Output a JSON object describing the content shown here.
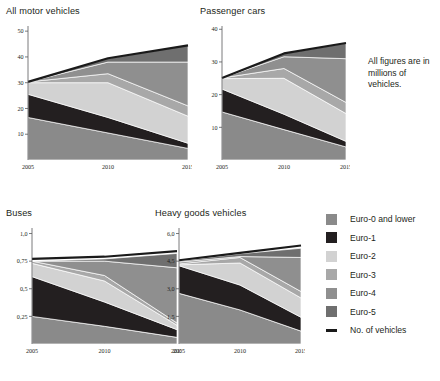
{
  "note": {
    "text": "All figures are in millions of vehicles."
  },
  "legend": {
    "items": [
      {
        "label": "Euro-0 and lower",
        "color": "#8a8a8a",
        "kind": "swatch"
      },
      {
        "label": "Euro-1",
        "color": "#231f20",
        "kind": "swatch"
      },
      {
        "label": "Euro-2",
        "color": "#d2d2d2",
        "kind": "swatch"
      },
      {
        "label": "Euro-3",
        "color": "#a8a8a8",
        "kind": "swatch"
      },
      {
        "label": "Euro-4",
        "color": "#8f8f8f",
        "kind": "swatch"
      },
      {
        "label": "Euro-5",
        "color": "#6f6f6f",
        "kind": "swatch"
      },
      {
        "label": "No. of vehicles",
        "color": "#1a1a1a",
        "kind": "line"
      }
    ]
  },
  "chart_data": [
    {
      "type": "area",
      "id": "all-motor-vehicles",
      "title": "All motor vehicles",
      "stacked": true,
      "xlabel": "",
      "ylabel": "",
      "x": [
        2005,
        2010,
        2015
      ],
      "xticks": [
        "2005",
        "2010",
        "2015"
      ],
      "yticks": [
        "10",
        "20",
        "30",
        "40",
        "50"
      ],
      "ytickvals": [
        10,
        20,
        30,
        40,
        50
      ],
      "ylim": [
        0,
        52
      ],
      "grid": false,
      "legend_position": "right",
      "series": [
        {
          "name": "Euro-0 and lower",
          "color": "#8a8a8a",
          "values": [
            16.5,
            10.5,
            4.5
          ]
        },
        {
          "name": "Euro-1",
          "color": "#231f20",
          "values": [
            9.0,
            6.0,
            2.0
          ]
        },
        {
          "name": "Euro-2",
          "color": "#d2d2d2",
          "values": [
            4.5,
            13.5,
            10.5
          ]
        },
        {
          "name": "Euro-3",
          "color": "#a8a8a8",
          "values": [
            0.3,
            3.5,
            4.0
          ]
        },
        {
          "name": "Euro-4",
          "color": "#8f8f8f",
          "values": [
            0.0,
            4.5,
            17.0
          ]
        },
        {
          "name": "Euro-5",
          "color": "#6f6f6f",
          "values": [
            0.0,
            1.5,
            6.5
          ]
        }
      ],
      "total_line": {
        "name": "No. of vehicles",
        "color": "#1a1a1a",
        "values": [
          30.3,
          39.5,
          44.5
        ]
      }
    },
    {
      "type": "area",
      "id": "passenger-cars",
      "title": "Passenger cars",
      "stacked": true,
      "xlabel": "",
      "ylabel": "",
      "x": [
        2005,
        2010,
        2015
      ],
      "xticks": [
        "2005",
        "2010",
        "2015"
      ],
      "yticks": [
        "10",
        "20",
        "30",
        "40"
      ],
      "ytickvals": [
        10,
        20,
        30,
        40
      ],
      "ylim": [
        0,
        41
      ],
      "grid": false,
      "legend_position": "right",
      "series": [
        {
          "name": "Euro-0 and lower",
          "color": "#8a8a8a",
          "values": [
            14.7,
            9.3,
            4.0
          ]
        },
        {
          "name": "Euro-1",
          "color": "#231f20",
          "values": [
            7.0,
            4.7,
            1.7
          ]
        },
        {
          "name": "Euro-2",
          "color": "#d2d2d2",
          "values": [
            3.2,
            11.0,
            8.5
          ]
        },
        {
          "name": "Euro-3",
          "color": "#a8a8a8",
          "values": [
            0.2,
            3.0,
            3.4
          ]
        },
        {
          "name": "Euro-4",
          "color": "#8f8f8f",
          "values": [
            0.0,
            3.6,
            13.4
          ]
        },
        {
          "name": "Euro-5",
          "color": "#6f6f6f",
          "values": [
            0.0,
            1.0,
            4.8
          ]
        }
      ],
      "total_line": {
        "name": "No. of vehicles",
        "color": "#1a1a1a",
        "values": [
          25.1,
          32.6,
          35.8
        ]
      }
    },
    {
      "type": "area",
      "id": "buses",
      "title": "Buses",
      "stacked": true,
      "xlabel": "",
      "ylabel": "",
      "x": [
        2005,
        2010,
        2015
      ],
      "xticks": [
        "2005",
        "2010",
        "2015"
      ],
      "yticks": [
        "0,25",
        "0,5",
        "0,75",
        "1,0"
      ],
      "ytickvals": [
        0.25,
        0.5,
        0.75,
        1.0
      ],
      "ylim": [
        0,
        1.05
      ],
      "grid": false,
      "legend_position": "right",
      "series": [
        {
          "name": "Euro-0 and lower",
          "color": "#8a8a8a",
          "values": [
            0.25,
            0.16,
            0.06
          ]
        },
        {
          "name": "Euro-1",
          "color": "#231f20",
          "values": [
            0.36,
            0.22,
            0.07
          ]
        },
        {
          "name": "Euro-2",
          "color": "#d2d2d2",
          "values": [
            0.12,
            0.19,
            0.04
          ]
        },
        {
          "name": "Euro-3",
          "color": "#a8a8a8",
          "values": [
            0.02,
            0.05,
            0.02
          ]
        },
        {
          "name": "Euro-4",
          "color": "#8f8f8f",
          "values": [
            0.0,
            0.13,
            0.5
          ]
        },
        {
          "name": "Euro-5",
          "color": "#6f6f6f",
          "values": [
            0.0,
            0.02,
            0.13
          ]
        }
      ],
      "total_line": {
        "name": "No. of vehicles",
        "color": "#1a1a1a",
        "values": [
          0.77,
          0.79,
          0.84
        ]
      }
    },
    {
      "type": "area",
      "id": "heavy-goods-vehicles",
      "title": "Heavy goods vehicles",
      "stacked": true,
      "xlabel": "",
      "ylabel": "",
      "x": [
        2005,
        2010,
        2015
      ],
      "xticks": [
        "2005",
        "2010",
        "2015"
      ],
      "yticks": [
        "1,5",
        "3,0",
        "4,5",
        "6,0"
      ],
      "ytickvals": [
        1.5,
        3.0,
        4.5,
        6.0
      ],
      "ylim": [
        0,
        6.3
      ],
      "grid": false,
      "legend_position": "right",
      "series": [
        {
          "name": "Euro-0 and lower",
          "color": "#8a8a8a",
          "values": [
            2.75,
            1.85,
            0.7
          ]
        },
        {
          "name": "Euro-1",
          "color": "#231f20",
          "values": [
            1.5,
            1.35,
            0.75
          ]
        },
        {
          "name": "Euro-2",
          "color": "#d2d2d2",
          "values": [
            0.05,
            1.2,
            1.05
          ]
        },
        {
          "name": "Euro-3",
          "color": "#a8a8a8",
          "values": [
            0.05,
            0.3,
            0.35
          ]
        },
        {
          "name": "Euro-4",
          "color": "#8f8f8f",
          "values": [
            0.1,
            0.05,
            1.85
          ]
        },
        {
          "name": "Euro-5",
          "color": "#6f6f6f",
          "values": [
            0.05,
            0.15,
            0.5
          ]
        }
      ],
      "total_line": {
        "name": "No. of vehicles",
        "color": "#1a1a1a",
        "values": [
          4.55,
          4.95,
          5.35
        ]
      }
    }
  ]
}
